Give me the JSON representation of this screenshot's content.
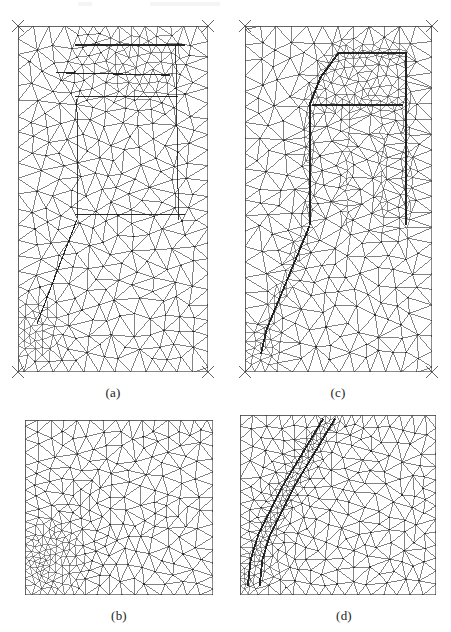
{
  "figure": {
    "background_color": "#ffffff",
    "line_color": "#2a2a2a",
    "frame_color": "#555555",
    "width": 451,
    "height": 632
  },
  "captions": [
    {
      "id": "caption-a",
      "label": "(a)",
      "x": 113,
      "y": 386
    },
    {
      "id": "caption-c",
      "label": "(c)",
      "x": 338,
      "y": 386
    },
    {
      "id": "caption-b",
      "label": "(b)",
      "x": 119,
      "y": 609
    },
    {
      "id": "caption-d",
      "label": "(d)",
      "x": 344,
      "y": 609
    }
  ],
  "panels": [
    {
      "id": "panel-a",
      "label": "(a)",
      "name": "mesh-panel-a",
      "description": "Coarse background adaptive triangular mesh of full domain with moderate refinement band near top inclusion and dense refined cluster at lower-left corner",
      "x": 18,
      "y": 26,
      "width": 190,
      "height": 346,
      "base_spacing": 15.5,
      "jitter": 0.34,
      "corner_marks": true,
      "refine_regions": [
        {
          "type": "polygon",
          "shape": "top-inclusion-band",
          "level": 2.0,
          "points": [
            [
              0.3,
              0.02
            ],
            [
              0.86,
              0.02
            ],
            [
              0.9,
              0.1
            ],
            [
              0.86,
              0.21
            ],
            [
              0.52,
              0.235
            ],
            [
              0.33,
              0.21
            ],
            [
              0.26,
              0.11
            ]
          ]
        },
        {
          "type": "polygon",
          "shape": "top-inclusion-core",
          "level": 3.0,
          "points": [
            [
              0.5,
              0.04
            ],
            [
              0.82,
              0.045
            ],
            [
              0.85,
              0.12
            ],
            [
              0.74,
              0.2
            ],
            [
              0.52,
              0.195
            ],
            [
              0.45,
              0.12
            ]
          ]
        },
        {
          "type": "blob",
          "shape": "corner-crack-tip",
          "level": 5.2,
          "cx": 0.095,
          "cy": 0.875,
          "rx": 0.16,
          "ry": 0.105
        },
        {
          "type": "blob",
          "shape": "corner-crack-core",
          "level": 8.0,
          "cx": 0.075,
          "cy": 0.905,
          "rx": 0.085,
          "ry": 0.06
        }
      ],
      "feature_lines": [
        {
          "shape": "inclusion-top-edge",
          "points": [
            [
              0.3,
              0.055
            ],
            [
              0.88,
              0.055
            ]
          ],
          "weight": 1.5
        },
        {
          "shape": "inclusion-mid-edge",
          "points": [
            [
              0.2,
              0.135
            ],
            [
              0.8,
              0.142
            ]
          ],
          "weight": 1.2
        },
        {
          "shape": "inclusion-lower-edge",
          "points": [
            [
              0.3,
              0.205
            ],
            [
              0.84,
              0.205
            ]
          ],
          "weight": 1.0
        },
        {
          "shape": "structure-outline-right",
          "points": [
            [
              0.83,
              0.055
            ],
            [
              0.845,
              0.56
            ]
          ],
          "weight": 0.9
        },
        {
          "shape": "structure-outline-left",
          "points": [
            [
              0.31,
              0.21
            ],
            [
              0.315,
              0.555
            ]
          ],
          "weight": 0.9
        },
        {
          "shape": "horizontal-interface",
          "points": [
            [
              0.3,
              0.545
            ],
            [
              0.88,
              0.545
            ]
          ],
          "weight": 1.6
        },
        {
          "shape": "diagonal-shear-band",
          "points": [
            [
              0.31,
              0.56
            ],
            [
              0.1,
              0.86
            ]
          ],
          "weight": 1.1
        }
      ]
    },
    {
      "id": "panel-c",
      "label": "(c)",
      "name": "mesh-panel-c",
      "description": "Adapted triangular mesh of same domain with strongly refined narrow band tracing an inverted-U arch at top and a diagonal band running to the lower-left corner",
      "x": 245,
      "y": 26,
      "width": 187,
      "height": 346,
      "base_spacing": 15.5,
      "jitter": 0.34,
      "corner_marks": true,
      "refine_regions": [
        {
          "type": "band",
          "shape": "arch-left-leg",
          "level": 7.5,
          "half_width": 0.02,
          "points": [
            [
              0.345,
              0.575
            ],
            [
              0.345,
              0.225
            ],
            [
              0.405,
              0.145
            ],
            [
              0.5,
              0.075
            ]
          ]
        },
        {
          "type": "band",
          "shape": "arch-top",
          "level": 7.5,
          "half_width": 0.02,
          "points": [
            [
              0.5,
              0.075
            ],
            [
              0.86,
              0.075
            ]
          ]
        },
        {
          "type": "band",
          "shape": "arch-right-leg",
          "level": 7.5,
          "half_width": 0.02,
          "points": [
            [
              0.86,
              0.075
            ],
            [
              0.865,
              0.575
            ]
          ]
        },
        {
          "type": "band",
          "shape": "arch-inner-crossbar",
          "level": 7.0,
          "half_width": 0.018,
          "points": [
            [
              0.36,
              0.225
            ],
            [
              0.845,
              0.225
            ]
          ]
        },
        {
          "type": "band",
          "shape": "arch-inner-left",
          "level": 6.5,
          "half_width": 0.016,
          "points": [
            [
              0.545,
              0.235
            ],
            [
              0.545,
              0.575
            ]
          ]
        },
        {
          "type": "band",
          "shape": "arch-inner-right",
          "level": 6.5,
          "half_width": 0.016,
          "points": [
            [
              0.735,
              0.235
            ],
            [
              0.735,
              0.575
            ]
          ]
        },
        {
          "type": "band",
          "shape": "diagonal-shear-band",
          "level": 8.0,
          "half_width": 0.022,
          "points": [
            [
              0.345,
              0.575
            ],
            [
              0.115,
              0.875
            ],
            [
              0.085,
              0.945
            ]
          ]
        },
        {
          "type": "blob",
          "shape": "corner-crack-tip",
          "level": 6.0,
          "cx": 0.085,
          "cy": 0.935,
          "rx": 0.13,
          "ry": 0.075
        },
        {
          "type": "polygon",
          "shape": "arch-head-patch",
          "level": 3.2,
          "points": [
            [
              0.4,
              0.085
            ],
            [
              0.86,
              0.085
            ],
            [
              0.86,
              0.215
            ],
            [
              0.4,
              0.215
            ]
          ]
        }
      ],
      "feature_lines": [
        {
          "shape": "arch-outer-contour",
          "weight": 2.0,
          "points": [
            [
              0.345,
              0.575
            ],
            [
              0.345,
              0.228
            ],
            [
              0.405,
              0.148
            ],
            [
              0.5,
              0.078
            ],
            [
              0.86,
              0.078
            ],
            [
              0.862,
              0.575
            ]
          ]
        },
        {
          "shape": "arch-crossbar-contour",
          "weight": 1.6,
          "points": [
            [
              0.36,
              0.228
            ],
            [
              0.845,
              0.228
            ]
          ]
        },
        {
          "shape": "diagonal-band-contour",
          "weight": 1.8,
          "points": [
            [
              0.345,
              0.578
            ],
            [
              0.115,
              0.878
            ],
            [
              0.085,
              0.948
            ]
          ]
        }
      ]
    },
    {
      "id": "panel-b",
      "label": "(b)",
      "name": "mesh-panel-b",
      "description": "Close-up of the lower-left corner region of mesh (a) showing graded dense refinement clustered at the crack tip",
      "x": 25,
      "y": 420,
      "width": 188,
      "height": 175,
      "base_spacing": 13.0,
      "jitter": 0.32,
      "corner_marks": false,
      "refine_regions": [
        {
          "type": "blob",
          "shape": "crack-tip-cluster",
          "level": 6.5,
          "cx": 0.115,
          "cy": 0.795,
          "rx": 0.215,
          "ry": 0.25
        },
        {
          "type": "blob",
          "shape": "crack-tip-core",
          "level": 10.0,
          "cx": 0.085,
          "cy": 0.845,
          "rx": 0.1,
          "ry": 0.12
        },
        {
          "type": "blob",
          "shape": "crack-tip-halo",
          "level": 2.2,
          "cx": 0.16,
          "cy": 0.75,
          "rx": 0.33,
          "ry": 0.36
        }
      ],
      "feature_lines": []
    },
    {
      "id": "panel-d",
      "label": "(d)",
      "name": "mesh-panel-d",
      "description": "Close-up of mesh (c) near the lower-left corner showing the narrow strongly refined diagonal band turning back on itself at the crack tip",
      "x": 240,
      "y": 415,
      "width": 196,
      "height": 180,
      "base_spacing": 13.0,
      "jitter": 0.32,
      "corner_marks": false,
      "refine_regions": [
        {
          "type": "band",
          "shape": "diagonal-band-main",
          "level": 9.0,
          "half_width": 0.03,
          "points": [
            [
              0.455,
              0.02
            ],
            [
              0.245,
              0.4
            ],
            [
              0.125,
              0.66
            ],
            [
              0.085,
              0.78
            ]
          ]
        },
        {
          "type": "band",
          "shape": "diagonal-band-return",
          "level": 9.0,
          "half_width": 0.026,
          "points": [
            [
              0.085,
              0.78
            ],
            [
              0.045,
              0.86
            ],
            [
              0.04,
              0.95
            ]
          ]
        },
        {
          "type": "band",
          "shape": "diagonal-band-halo",
          "level": 2.6,
          "half_width": 0.075,
          "points": [
            [
              0.47,
              0.02
            ],
            [
              0.2,
              0.5
            ],
            [
              0.075,
              0.8
            ],
            [
              0.05,
              0.95
            ]
          ]
        },
        {
          "type": "blob",
          "shape": "band-tip-cluster",
          "level": 4.0,
          "cx": 0.1,
          "cy": 0.84,
          "rx": 0.17,
          "ry": 0.16
        }
      ],
      "feature_lines": [
        {
          "shape": "band-outline-left",
          "weight": 1.8,
          "points": [
            [
              0.425,
              0.02
            ],
            [
              0.215,
              0.4
            ],
            [
              0.095,
              0.66
            ],
            [
              0.055,
              0.8
            ],
            [
              0.04,
              0.95
            ]
          ]
        },
        {
          "shape": "band-outline-right",
          "weight": 1.8,
          "points": [
            [
              0.485,
              0.02
            ],
            [
              0.275,
              0.4
            ],
            [
              0.155,
              0.66
            ],
            [
              0.115,
              0.8
            ],
            [
              0.1,
              0.95
            ]
          ]
        }
      ]
    }
  ]
}
